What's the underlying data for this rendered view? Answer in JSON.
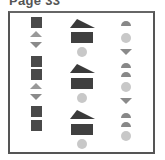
{
  "page": {
    "title": "Page 33"
  },
  "colors": {
    "border": "#555555",
    "dark_fill": "#404040",
    "mid_fill": "#888888",
    "light_fill": "#c8c8c8"
  },
  "columns": [
    {
      "name": "left",
      "shapes": [
        "square",
        "triangle-up",
        "triangle-down",
        "square",
        "square",
        "triangle-up",
        "triangle-down",
        "square",
        "square"
      ]
    },
    {
      "name": "middle",
      "shapes": [
        "wedge",
        "rectangle",
        "circle",
        "wedge",
        "rectangle",
        "circle",
        "wedge",
        "rectangle",
        "circle"
      ]
    },
    {
      "name": "right",
      "shapes": [
        "semicircle",
        "circle",
        "triangle-down",
        "semicircle",
        "semicircle",
        "circle",
        "triangle-down",
        "semicircle",
        "semicircle",
        "circle"
      ]
    }
  ]
}
